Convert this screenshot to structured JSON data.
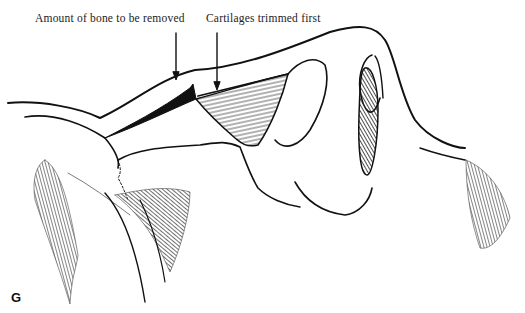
{
  "figure": {
    "panel_letter": "G",
    "annotations": [
      {
        "text": "Amount of bone to be removed",
        "x": 35,
        "y": 12
      },
      {
        "text": "Cartilages trimmed first",
        "x": 206,
        "y": 12
      }
    ],
    "colors": {
      "ink": "#111111",
      "background": "#ffffff"
    }
  }
}
